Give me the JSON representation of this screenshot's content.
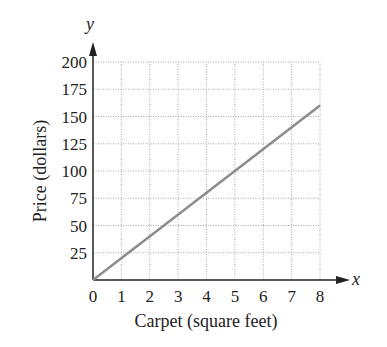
{
  "chart_data": {
    "type": "line",
    "title": "",
    "xlabel": "Carpet (square feet)",
    "ylabel": "Price (dollars)",
    "x_axis_var": "x",
    "y_axis_var": "y",
    "xlim": [
      0,
      8
    ],
    "ylim": [
      0,
      200
    ],
    "x_ticks": [
      "0",
      "1",
      "2",
      "3",
      "4",
      "5",
      "6",
      "7",
      "8"
    ],
    "y_ticks": [
      "25",
      "50",
      "75",
      "100",
      "125",
      "150",
      "175",
      "200"
    ],
    "grid": true,
    "series": [
      {
        "name": "Price",
        "x": [
          0,
          8
        ],
        "y": [
          0,
          160
        ],
        "color": "#8c8c8c"
      }
    ]
  }
}
